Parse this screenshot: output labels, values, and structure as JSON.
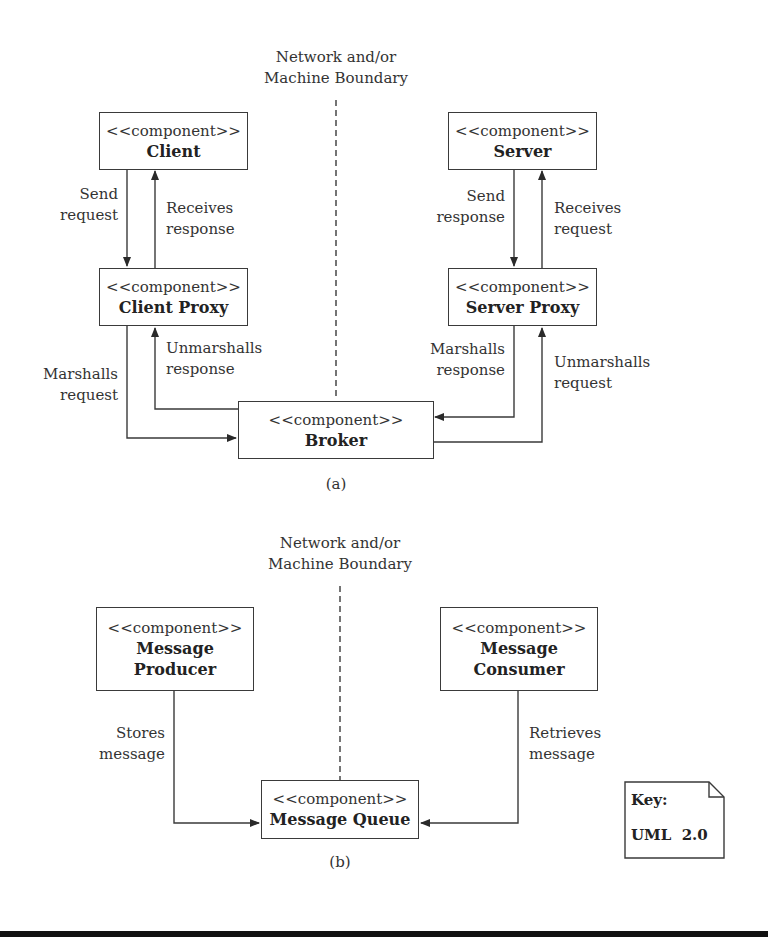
{
  "diagram_a": {
    "boundary_label": [
      "Network and/or",
      "Machine Boundary"
    ],
    "caption": "(a)",
    "components": {
      "client": {
        "stereotype": "<<component>>",
        "name": "Client"
      },
      "client_proxy": {
        "stereotype": "<<component>>",
        "name": "Client Proxy"
      },
      "server": {
        "stereotype": "<<component>>",
        "name": "Server"
      },
      "server_proxy": {
        "stereotype": "<<component>>",
        "name": "Server Proxy"
      },
      "broker": {
        "stereotype": "<<component>>",
        "name": "Broker"
      }
    },
    "connectors": {
      "send_request": [
        "Send",
        "request"
      ],
      "receives_response": [
        "Receives",
        "response"
      ],
      "send_response": [
        "Send",
        "response"
      ],
      "receives_request": [
        "Receives",
        "request"
      ],
      "marshalls_request": [
        "Marshalls",
        "request"
      ],
      "unmarshalls_response": [
        "Unmarshalls",
        "response"
      ],
      "marshalls_response": [
        "Marshalls",
        "response"
      ],
      "unmarshalls_request": [
        "Unmarshalls",
        "request"
      ]
    }
  },
  "diagram_b": {
    "boundary_label": [
      "Network and/or",
      "Machine Boundary"
    ],
    "caption": "(b)",
    "components": {
      "producer": {
        "stereotype": "<<component>>",
        "name": [
          "Message",
          "Producer"
        ]
      },
      "consumer": {
        "stereotype": "<<component>>",
        "name": [
          "Message",
          "Consumer"
        ]
      },
      "queue": {
        "stereotype": "<<component>>",
        "name": "Message Queue"
      }
    },
    "connectors": {
      "stores_message": [
        "Stores",
        "message"
      ],
      "retrieves_message": [
        "Retrieves",
        "message"
      ]
    }
  },
  "key": {
    "title": "Key:",
    "value": "UML  2.0"
  },
  "colors": {
    "line": "#3a3a3a",
    "text": "#2a2a2a",
    "background": "#ffffff",
    "bottom_rule": "#111111"
  }
}
